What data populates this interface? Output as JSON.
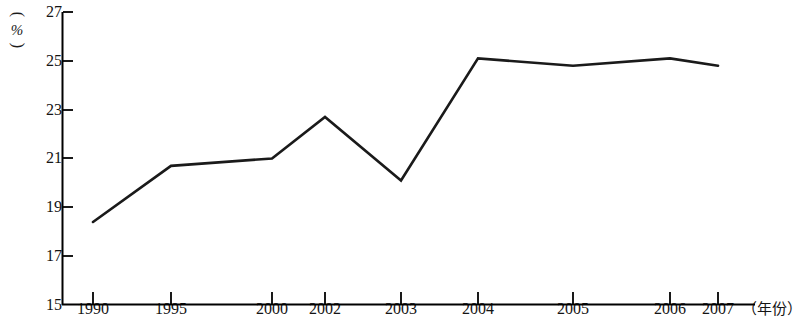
{
  "chart_data": {
    "type": "line",
    "title": "",
    "xlabel": "（年份）",
    "ylabel": "（%）",
    "x": [
      "1990",
      "1995",
      "2000",
      "2002",
      "2003",
      "2004",
      "2005",
      "2006",
      "2007"
    ],
    "categories": [
      "1990",
      "1995",
      "2000",
      "2002",
      "2003",
      "2004",
      "2005",
      "2006",
      "2007"
    ],
    "values": [
      18.4,
      20.7,
      21.0,
      22.7,
      20.1,
      25.1,
      24.8,
      25.1,
      24.8
    ],
    "series": [
      {
        "name": "",
        "values": [
          18.4,
          20.7,
          21.0,
          22.7,
          20.1,
          25.1,
          24.8,
          25.1,
          24.8
        ]
      }
    ],
    "ylim": [
      15,
      27
    ],
    "y_ticks": [
      15,
      17,
      19,
      21,
      23,
      25,
      27
    ],
    "y_tick_labels": [
      "15",
      "17",
      "19",
      "21",
      "23",
      "25",
      "27"
    ],
    "x_tick_labels": [
      "1990",
      "1995",
      "2000",
      "2002",
      "2003",
      "2004",
      "2005",
      "2006",
      "2007"
    ],
    "grid": false,
    "legend": "none",
    "line_color": "#1a1a1a",
    "axis_color": "#000000",
    "background_color": "#ffffff",
    "markers": false
  },
  "axis_unit": {
    "y_open_paren": "(",
    "y_symbol": "%",
    "y_close_paren": ")",
    "x_label": "（年份）"
  }
}
